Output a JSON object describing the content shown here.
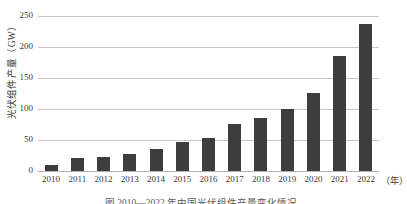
{
  "chart_data": {
    "type": "bar",
    "title": "",
    "xlabel": "（年）",
    "ylabel": "光伏组件产量（GW）",
    "categories": [
      "2010",
      "2011",
      "2012",
      "2013",
      "2014",
      "2015",
      "2016",
      "2017",
      "2018",
      "2019",
      "2020",
      "2021",
      "2022"
    ],
    "values": [
      10,
      21,
      23,
      28,
      36,
      47,
      54,
      76,
      85,
      100,
      126,
      185,
      237
    ],
    "ylim": [
      0,
      250
    ],
    "yticks": [
      "250",
      "200",
      "150",
      "100",
      "50",
      "0"
    ],
    "ytick_values": [
      250,
      200,
      150,
      100,
      50,
      0
    ],
    "grid": "horizontal",
    "legend": "none",
    "bar_color": "#3d3d3d",
    "gridline_color": "#c8c8c8",
    "background_color": "#ffffff"
  },
  "axes": {
    "y_title": "光伏组件产量（GW）",
    "x_unit": "（年）"
  },
  "caption": {
    "text": "图  2010—2022 年中国光伏组件产量变化情况"
  }
}
